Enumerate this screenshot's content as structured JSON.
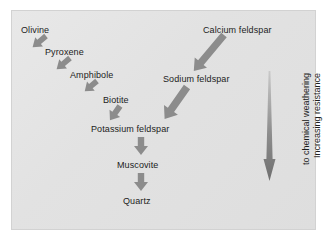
{
  "diagram": {
    "background_color": "#e4e4e4",
    "arrow_color": "#8a8a8a",
    "text_color": "#1c1c1c",
    "nodes": [
      {
        "id": "olivine",
        "label": "Olivine"
      },
      {
        "id": "pyroxene",
        "label": "Pyroxene"
      },
      {
        "id": "amphibole",
        "label": "Amphibole"
      },
      {
        "id": "biotite",
        "label": "Biotite"
      },
      {
        "id": "calcium-feldspar",
        "label": "Calcium feldspar"
      },
      {
        "id": "sodium-feldspar",
        "label": "Sodium feldspar"
      },
      {
        "id": "potassium-feldspar",
        "label": "Potassium feldspar"
      },
      {
        "id": "muscovite",
        "label": "Muscovite"
      },
      {
        "id": "quartz",
        "label": "Quartz"
      }
    ],
    "edges": [
      {
        "from": "olivine",
        "to": "pyroxene",
        "direction": "down-right"
      },
      {
        "from": "pyroxene",
        "to": "amphibole",
        "direction": "down-right"
      },
      {
        "from": "amphibole",
        "to": "biotite",
        "direction": "down-right"
      },
      {
        "from": "biotite",
        "to": "potassium-feldspar",
        "direction": "down-right"
      },
      {
        "from": "calcium-feldspar",
        "to": "sodium-feldspar",
        "direction": "down-left"
      },
      {
        "from": "sodium-feldspar",
        "to": "potassium-feldspar",
        "direction": "down-left"
      },
      {
        "from": "potassium-feldspar",
        "to": "muscovite",
        "direction": "down"
      },
      {
        "from": "muscovite",
        "to": "quartz",
        "direction": "down"
      }
    ],
    "axis": {
      "line1": "Increasing resistance",
      "line2": "to chemical weathering",
      "arrow_direction": "down"
    }
  }
}
